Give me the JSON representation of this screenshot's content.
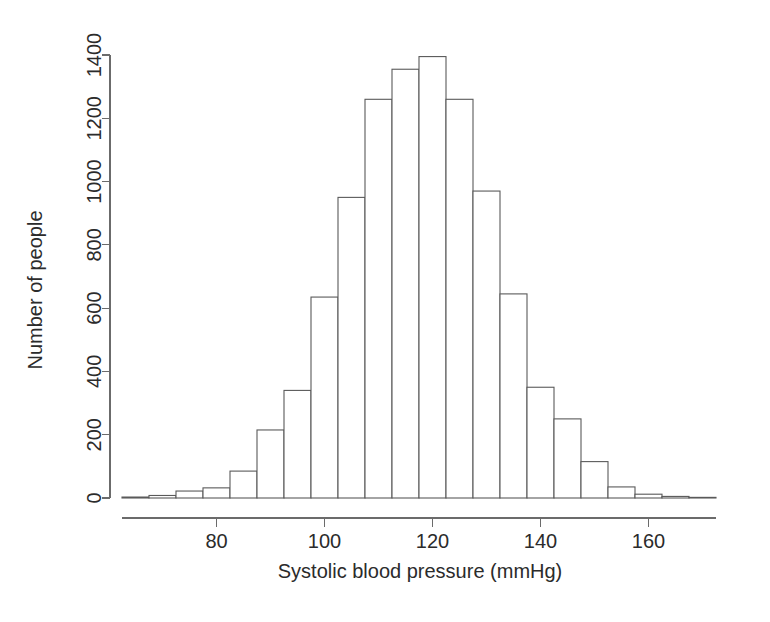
{
  "chart_data": {
    "type": "bar",
    "title": "",
    "subtitle": "",
    "xlabel": "Systolic blood pressure (mmHg)",
    "ylabel": "Number of people",
    "grid": false,
    "legend": false,
    "legend_position": "none",
    "bin_width": 5,
    "xlim": [
      62.5,
      172.5
    ],
    "ylim": [
      0,
      1440
    ],
    "xticks": [
      80,
      100,
      120,
      140,
      160
    ],
    "xtick_labels": [
      "80",
      "100",
      "120",
      "140",
      "160"
    ],
    "yticks": [
      0,
      200,
      400,
      600,
      800,
      1000,
      1200,
      1400
    ],
    "ytick_labels": [
      "0",
      "200",
      "400",
      "600",
      "800",
      "1000",
      "1200",
      "1400"
    ],
    "bin_starts": [
      62.5,
      67.5,
      72.5,
      77.5,
      82.5,
      87.5,
      92.5,
      97.5,
      102.5,
      107.5,
      112.5,
      117.5,
      122.5,
      127.5,
      132.5,
      137.5,
      142.5,
      147.5,
      152.5,
      157.5,
      162.5,
      167.5
    ],
    "categories": [
      "62.5-67.5",
      "67.5-72.5",
      "72.5-77.5",
      "77.5-82.5",
      "82.5-87.5",
      "87.5-92.5",
      "92.5-97.5",
      "97.5-102.5",
      "102.5-107.5",
      "107.5-112.5",
      "112.5-117.5",
      "117.5-122.5",
      "122.5-127.5",
      "127.5-132.5",
      "132.5-137.5",
      "137.5-142.5",
      "142.5-147.5",
      "147.5-152.5",
      "152.5-157.5",
      "157.5-162.5",
      "162.5-167.5",
      "167.5-172.5"
    ],
    "values": [
      3,
      8,
      22,
      32,
      85,
      215,
      340,
      635,
      950,
      1260,
      1355,
      1395,
      1260,
      970,
      645,
      350,
      250,
      115,
      35,
      12,
      5,
      2
    ]
  },
  "axis": {
    "x_title": "Systolic blood pressure (mmHg)",
    "y_title": "Number of people"
  }
}
